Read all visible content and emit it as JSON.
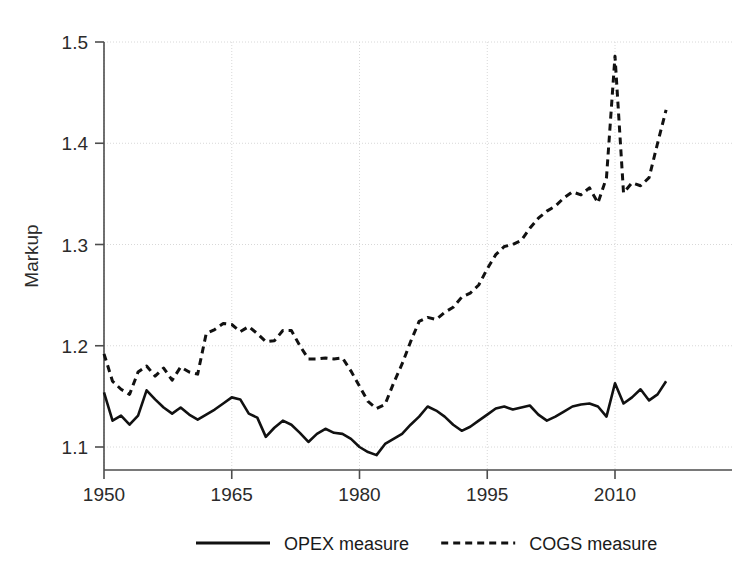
{
  "chart_data": {
    "type": "line",
    "title": "",
    "xlabel": "",
    "ylabel": "Markup",
    "xlim": [
      1950,
      2016
    ],
    "ylim": [
      1.085,
      1.52
    ],
    "xticks": [
      1950,
      1965,
      1980,
      1995,
      2010
    ],
    "xtick_labels": [
      "1950",
      "1965",
      "1980",
      "1995",
      "2010"
    ],
    "yticks": [
      1.1,
      1.2,
      1.3,
      1.4,
      1.5
    ],
    "ytick_labels": [
      "1.1",
      "1.2",
      "1.3",
      "1.4",
      "1.5"
    ],
    "grid": true,
    "legend_position": "below",
    "x": [
      1950,
      1951,
      1952,
      1953,
      1954,
      1955,
      1956,
      1957,
      1958,
      1959,
      1960,
      1961,
      1962,
      1963,
      1964,
      1965,
      1966,
      1967,
      1968,
      1969,
      1970,
      1971,
      1972,
      1973,
      1974,
      1975,
      1976,
      1977,
      1978,
      1979,
      1980,
      1981,
      1982,
      1983,
      1984,
      1985,
      1986,
      1987,
      1988,
      1989,
      1990,
      1991,
      1992,
      1993,
      1994,
      1995,
      1996,
      1997,
      1998,
      1999,
      2000,
      2001,
      2002,
      2003,
      2004,
      2005,
      2006,
      2007,
      2008,
      2009,
      2010,
      2011,
      2012,
      2013,
      2014,
      2015,
      2016
    ],
    "series": [
      {
        "name": "OPEX measure",
        "style": "solid",
        "color": "#111111",
        "values": [
          1.154,
          1.126,
          1.131,
          1.122,
          1.131,
          1.156,
          1.147,
          1.139,
          1.133,
          1.139,
          1.132,
          1.127,
          1.132,
          1.137,
          1.143,
          1.149,
          1.147,
          1.133,
          1.129,
          1.11,
          1.119,
          1.126,
          1.122,
          1.114,
          1.105,
          1.113,
          1.118,
          1.114,
          1.113,
          1.108,
          1.1,
          1.095,
          1.092,
          1.103,
          1.108,
          1.113,
          1.122,
          1.13,
          1.14,
          1.136,
          1.13,
          1.122,
          1.116,
          1.12,
          1.126,
          1.132,
          1.138,
          1.14,
          1.137,
          1.139,
          1.141,
          1.132,
          1.126,
          1.13,
          1.135,
          1.14,
          1.142,
          1.143,
          1.14,
          1.13,
          1.163,
          1.143,
          1.149,
          1.157,
          1.146,
          1.152,
          1.165
        ]
      },
      {
        "name": "COGS measure",
        "style": "dashed",
        "color": "#111111",
        "values": [
          1.192,
          1.165,
          1.157,
          1.152,
          1.174,
          1.18,
          1.17,
          1.178,
          1.166,
          1.179,
          1.174,
          1.172,
          1.212,
          1.216,
          1.222,
          1.221,
          1.214,
          1.219,
          1.212,
          1.204,
          1.205,
          1.215,
          1.215,
          1.2,
          1.187,
          1.187,
          1.188,
          1.187,
          1.188,
          1.175,
          1.16,
          1.145,
          1.138,
          1.142,
          1.163,
          1.182,
          1.204,
          1.224,
          1.228,
          1.226,
          1.233,
          1.238,
          1.248,
          1.252,
          1.26,
          1.276,
          1.29,
          1.298,
          1.3,
          1.304,
          1.316,
          1.326,
          1.333,
          1.338,
          1.346,
          1.352,
          1.349,
          1.356,
          1.341,
          1.366,
          1.486,
          1.351,
          1.361,
          1.358,
          1.366,
          1.4,
          1.433
        ]
      }
    ],
    "legend": [
      {
        "label": "OPEX measure",
        "style": "solid"
      },
      {
        "label": "COGS measure",
        "style": "dashed"
      }
    ]
  },
  "colors": {
    "line": "#111111",
    "axis": "#4d4d4d",
    "grid": "#d8d8d8",
    "text": "#2b2b2b",
    "background": "#ffffff"
  }
}
